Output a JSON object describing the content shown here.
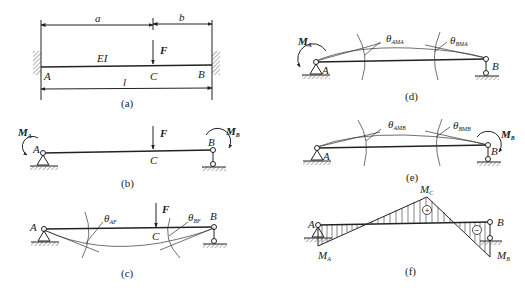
{
  "figure": {
    "panels": [
      {
        "id": "a",
        "caption": "(a)",
        "labels": {
          "a": "a",
          "b": "b",
          "F": "F",
          "EI": "EI",
          "A": "A",
          "C": "C",
          "B": "B",
          "l": "l"
        },
        "description": "Fixed-fixed beam AB of length l with stiffness EI, concentrated load F at C (distance a from A, b from B)"
      },
      {
        "id": "b",
        "caption": "(b)",
        "labels": {
          "MA": "M",
          "MA_sub": "A",
          "MB": "M",
          "MB_sub": "B",
          "F": "F",
          "A": "A",
          "C": "C",
          "B": "B"
        },
        "description": "Simply supported equivalent beam with end moments MA, MB and load F"
      },
      {
        "id": "c",
        "caption": "(c)",
        "labels": {
          "A": "A",
          "B": "B",
          "C": "C",
          "F": "F",
          "thetaAF": "θ",
          "thetaAF_sub": "AF",
          "thetaBF": "θ",
          "thetaBF_sub": "BF"
        },
        "description": "Deflection under F with end rotations θAF, θBF"
      },
      {
        "id": "d",
        "caption": "(d)",
        "labels": {
          "MA": "M",
          "MA_sub": "A",
          "A": "A",
          "B": "B",
          "thetaAMA": "θ",
          "thetaAMA_sub": "AMA",
          "thetaBMA": "θ",
          "thetaBMA_sub": "BMA"
        },
        "description": "Deflection under MA with end rotations θAMA, θBMA"
      },
      {
        "id": "e",
        "caption": "(e)",
        "labels": {
          "MB": "M",
          "MB_sub": "B",
          "A": "A",
          "B": "B",
          "thetaAMB": "θ",
          "thetaAMB_sub": "AMB",
          "thetaBMB": "θ",
          "thetaBMB_sub": "BMB"
        },
        "description": "Deflection under MB with end rotations θAMB, θBMB"
      },
      {
        "id": "f",
        "caption": "(f)",
        "labels": {
          "A": "A",
          "B": "B",
          "MC": "M",
          "MC_sub": "C",
          "MA": "M",
          "MA_sub": "A",
          "MB": "M",
          "MB_sub": "B",
          "plus": "+",
          "minus": "−"
        },
        "description": "Bending moment diagram: negative end moments MA, MB, positive peak MC under load"
      }
    ]
  }
}
